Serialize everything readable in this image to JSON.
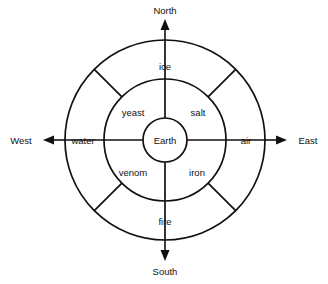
{
  "diagram": {
    "geometry": {
      "center_x": 165,
      "center_y": 140,
      "outer_radius": 100,
      "middle_radius": 61,
      "inner_radius": 22
    },
    "colors": {
      "stroke": "#111111",
      "background": "#ffffff"
    },
    "center": {
      "label": "Earth"
    },
    "outer_ring": {
      "segments": [
        {
          "key": "north",
          "label": "ice",
          "angle_deg": 90,
          "label_x": 165,
          "label_y": 67
        },
        {
          "key": "east",
          "label": "air",
          "angle_deg": 0,
          "label_x": 246,
          "label_y": 141
        },
        {
          "key": "south",
          "label": "fire",
          "angle_deg": 270,
          "label_x": 165,
          "label_y": 222
        },
        {
          "key": "west",
          "label": "water",
          "angle_deg": 180,
          "label_x": 83,
          "label_y": 141
        }
      ]
    },
    "inner_ring": {
      "segments": [
        {
          "key": "northwest",
          "label": "yeast",
          "angle_deg": 135,
          "label_x": 133,
          "label_y": 113
        },
        {
          "key": "northeast",
          "label": "salt",
          "angle_deg": 45,
          "label_x": 198,
          "label_y": 113
        },
        {
          "key": "southeast",
          "label": "iron",
          "angle_deg": 315,
          "label_x": 197,
          "label_y": 173
        },
        {
          "key": "southwest",
          "label": "venom",
          "angle_deg": 225,
          "label_x": 133,
          "label_y": 173
        }
      ]
    },
    "compass": {
      "points": [
        {
          "key": "north",
          "label": "North",
          "label_x": 165,
          "label_y": 11
        },
        {
          "key": "east",
          "label": "East",
          "label_x": 308,
          "label_y": 141
        },
        {
          "key": "south",
          "label": "South",
          "label_x": 165,
          "label_y": 272
        },
        {
          "key": "west",
          "label": "West",
          "label_x": 21,
          "label_y": 141
        }
      ]
    }
  }
}
